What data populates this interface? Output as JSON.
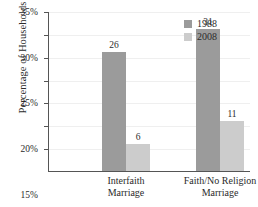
{
  "chart_data": {
    "type": "bar",
    "title": "",
    "subtitle": "",
    "xlabel": "",
    "ylabel": "Percentage of Households",
    "categories": [
      "Interfaith\nMarriage",
      "Faith/No Religion\nMarriage"
    ],
    "category_lines": [
      [
        "Interfaith",
        "Marriage"
      ],
      [
        "Faith/No Religion",
        "Marriage"
      ]
    ],
    "series": [
      {
        "name": "1988",
        "values": [
          26,
          31
        ],
        "color": "#9b9b9b"
      },
      {
        "name": "2008",
        "values": [
          6,
          11
        ],
        "color": "#cccccc"
      }
    ],
    "series_by_group": [
      {
        "category": "Interfaith Marriage",
        "1988": 26,
        "2008": 31
      },
      {
        "category": "Faith/No Religion Marriage",
        "1988": 6,
        "2008": 11
      }
    ],
    "bars": [
      {
        "group": 0,
        "series": "1988",
        "value": 26,
        "label": "26"
      },
      {
        "group": 0,
        "series": "2008",
        "value": 31,
        "label": "31"
      },
      {
        "group": 1,
        "series": "1988",
        "value": 6,
        "label": "6"
      },
      {
        "group": 1,
        "series": "2008",
        "value": 11,
        "label": "11"
      }
    ],
    "ylim": [
      0,
      35
    ],
    "ytick_values": [
      5,
      10,
      15,
      20,
      25,
      30,
      35
    ],
    "ytick_labels": [
      "5%",
      "10%",
      "15%",
      "20%",
      "25%",
      "30%",
      "35%"
    ],
    "grid": true,
    "grid_axis": "y",
    "legend": {
      "position": "top-right",
      "entries": [
        "1988",
        "2008"
      ]
    },
    "data_labels": true,
    "axis_color": "#555555",
    "grid_color": "#efefef",
    "background": "#ffffff"
  }
}
